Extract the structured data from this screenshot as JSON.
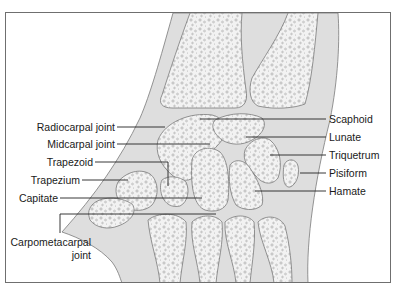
{
  "figure": {
    "colors": {
      "frame": "#6f6f6f",
      "soft_tissue": "#dedede",
      "bone": "#f2f2f2",
      "outline": "#7a7a7a",
      "leader": "#222222"
    }
  },
  "labels": {
    "left": [
      {
        "id": "radiocarpal",
        "text": "Radiocarpal joint"
      },
      {
        "id": "midcarpal",
        "text": "Midcarpal joint"
      },
      {
        "id": "trapezoid",
        "text": "Trapezoid"
      },
      {
        "id": "trapezium",
        "text": "Trapezium"
      },
      {
        "id": "capitate",
        "text": "Capitate"
      },
      {
        "id": "carpometacarpal_1",
        "text": "Carpometacarpal"
      },
      {
        "id": "carpometacarpal_2",
        "text": "joint"
      }
    ],
    "right": [
      {
        "id": "scaphoid",
        "text": "Scaphoid"
      },
      {
        "id": "lunate",
        "text": "Lunate"
      },
      {
        "id": "triquetrum",
        "text": "Triquetrum"
      },
      {
        "id": "pisiform",
        "text": "Pisiform"
      },
      {
        "id": "hamate",
        "text": "Hamate"
      }
    ]
  }
}
